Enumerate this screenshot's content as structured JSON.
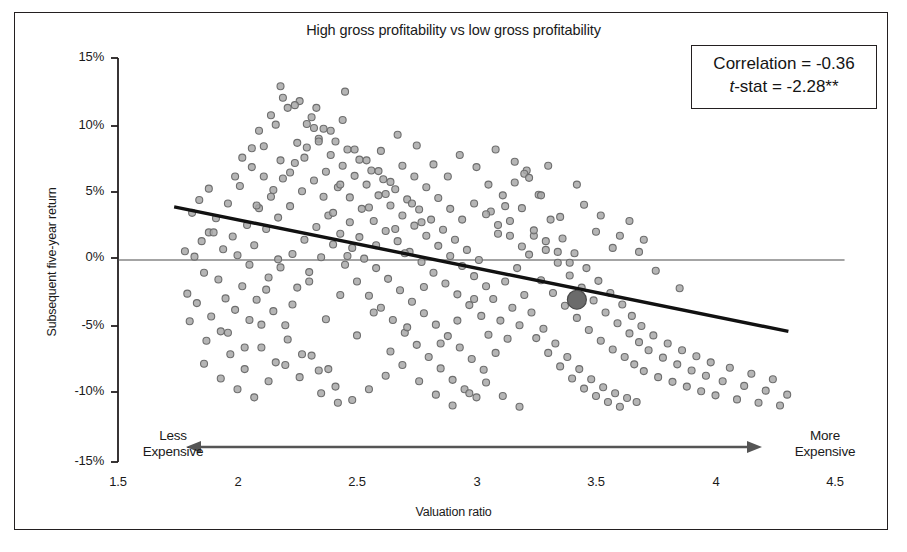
{
  "figure": {
    "title": "High gross profitability vs low gross profitability",
    "frame_color": "#231f20",
    "background": "#ffffff"
  },
  "stats_box": {
    "correlation_label": "Correlation = -0.36",
    "tstat_prefix": "t",
    "tstat_rest": "-stat = -2.28**"
  },
  "annotations": {
    "left_line1": "Less",
    "left_line2": "Expensive",
    "right_line1": "More",
    "right_line2": "Expensive",
    "arrow_name": "double-headed-arrow"
  },
  "chart_data": {
    "type": "scatter",
    "title": "High gross profitability vs low gross profitability",
    "xlabel": "Valuation ratio",
    "ylabel": "Subsequent five-year return",
    "xlim": [
      1.5,
      4.5
    ],
    "ylim": [
      -0.15,
      0.15
    ],
    "xticks": [
      1.5,
      2,
      2.5,
      3,
      3.5,
      4,
      4.5
    ],
    "xticklabels": [
      "1.5",
      "2",
      "2.5",
      "3",
      "3.5",
      "4",
      "4.5"
    ],
    "yticks": [
      0.15,
      0.1,
      0.05,
      0.0,
      -0.05,
      -0.1,
      -0.15
    ],
    "yticklabels": [
      "15%",
      "10%",
      "5%",
      "0%",
      "-5%",
      "-10%",
      "-15%"
    ],
    "grid": false,
    "legend": "none",
    "correlation": -0.36,
    "t_stat": -2.28,
    "significance": "**",
    "marker": {
      "shape": "circle",
      "fill": "#a8a8a8",
      "stroke": "#6e6e6e",
      "size_px": 7,
      "opacity": 0.85
    },
    "trendline": {
      "name": "linear-fit",
      "color": "#111111",
      "width_px": 3.4,
      "x_start": 1.735,
      "y_start": 0.0395,
      "x_end": 4.305,
      "y_end": -0.053
    },
    "zero_line": {
      "name": "zero-reference-line",
      "y": 0.0,
      "color": "#4b4b4b",
      "width_px": 1.1,
      "x_start": 1.5,
      "x_end": 4.54
    },
    "highlight_point": {
      "name": "current-valuation-marker",
      "x": 3.42,
      "y": -0.0295,
      "fill": "#6b6b6b",
      "stroke": "#4a4a4a",
      "size_px": 19
    },
    "points": [
      [
        1.78,
        0.0065
      ],
      [
        1.79,
        -0.025
      ],
      [
        1.8,
        -0.0455
      ],
      [
        1.82,
        0.0025
      ],
      [
        1.83,
        -0.032
      ],
      [
        1.85,
        0.014
      ],
      [
        1.86,
        -0.0095
      ],
      [
        1.87,
        -0.06
      ],
      [
        1.88,
        0.0205
      ],
      [
        1.89,
        -0.042
      ],
      [
        1.91,
        0.031
      ],
      [
        1.92,
        -0.0145
      ],
      [
        1.93,
        -0.053
      ],
      [
        1.94,
        0.008
      ],
      [
        1.95,
        -0.0285
      ],
      [
        1.96,
        0.042
      ],
      [
        1.97,
        -0.07
      ],
      [
        1.98,
        0.0175
      ],
      [
        1.99,
        -0.037
      ],
      [
        2.0,
        0.0035
      ],
      [
        2.01,
        0.055
      ],
      [
        2.02,
        -0.0195
      ],
      [
        2.03,
        -0.081
      ],
      [
        2.04,
        0.026
      ],
      [
        2.05,
        -0.0445
      ],
      [
        2.06,
        0.069
      ],
      [
        2.07,
        0.011
      ],
      [
        2.08,
        -0.0295
      ],
      [
        2.09,
        0.0385
      ],
      [
        2.1,
        -0.065
      ],
      [
        2.11,
        0.0845
      ],
      [
        2.12,
        0.023
      ],
      [
        2.13,
        -0.013
      ],
      [
        2.14,
        0.047
      ],
      [
        2.15,
        -0.038
      ],
      [
        2.16,
        0.1005
      ],
      [
        2.17,
        0.0315
      ],
      [
        2.18,
        -0.0055
      ],
      [
        2.19,
        0.0605
      ],
      [
        2.2,
        -0.0485
      ],
      [
        2.21,
        0.113
      ],
      [
        2.22,
        0.04
      ],
      [
        2.23,
        0.0045
      ],
      [
        2.24,
        0.072
      ],
      [
        2.25,
        -0.0205
      ],
      [
        2.26,
        0.118
      ],
      [
        2.27,
        0.051
      ],
      [
        2.28,
        0.015
      ],
      [
        2.29,
        0.0835
      ],
      [
        2.3,
        -0.009
      ],
      [
        2.31,
        0.106
      ],
      [
        2.32,
        0.059
      ],
      [
        2.33,
        0.0245
      ],
      [
        2.34,
        0.09
      ],
      [
        2.35,
        0.002
      ],
      [
        2.36,
        0.0975
      ],
      [
        2.37,
        0.0655
      ],
      [
        2.38,
        0.033
      ],
      [
        2.39,
        0.078
      ],
      [
        2.4,
        0.0115
      ],
      [
        2.41,
        0.088
      ],
      [
        2.42,
        0.054
      ],
      [
        2.43,
        0.0195
      ],
      [
        2.44,
        0.07
      ],
      [
        2.45,
        -0.0035
      ],
      [
        2.46,
        0.082
      ],
      [
        2.47,
        0.0465
      ],
      [
        2.48,
        0.009
      ],
      [
        2.49,
        0.0625
      ],
      [
        2.5,
        -0.016
      ],
      [
        2.51,
        0.0745
      ],
      [
        2.52,
        0.038
      ],
      [
        2.53,
        0.001
      ],
      [
        2.54,
        0.056
      ],
      [
        2.55,
        -0.0265
      ],
      [
        2.56,
        0.0665
      ],
      [
        2.57,
        0.029
      ],
      [
        2.58,
        -0.006
      ],
      [
        2.59,
        0.048
      ],
      [
        2.6,
        -0.0355
      ],
      [
        2.61,
        0.06
      ],
      [
        2.62,
        0.0215
      ],
      [
        2.63,
        -0.014
      ],
      [
        2.64,
        0.0405
      ],
      [
        2.65,
        -0.0445
      ],
      [
        2.66,
        0.0525
      ],
      [
        2.67,
        0.014
      ],
      [
        2.68,
        -0.0225
      ],
      [
        2.69,
        0.033
      ],
      [
        2.7,
        -0.054
      ],
      [
        2.71,
        0.045
      ],
      [
        2.72,
        0.006
      ],
      [
        2.73,
        -0.031
      ],
      [
        2.74,
        0.0255
      ],
      [
        2.75,
        -0.063
      ],
      [
        2.76,
        0.0375
      ],
      [
        2.77,
        -0.0015
      ],
      [
        2.78,
        -0.0395
      ],
      [
        2.79,
        0.018
      ],
      [
        2.8,
        -0.072
      ],
      [
        2.81,
        0.03
      ],
      [
        2.82,
        -0.0095
      ],
      [
        2.83,
        -0.048
      ],
      [
        2.84,
        0.0105
      ],
      [
        2.85,
        -0.0805
      ],
      [
        2.86,
        0.0225
      ],
      [
        2.87,
        -0.0175
      ],
      [
        2.88,
        -0.0565
      ],
      [
        2.89,
        0.003
      ],
      [
        2.9,
        -0.089
      ],
      [
        2.91,
        0.015
      ],
      [
        2.92,
        -0.0255
      ],
      [
        2.93,
        -0.065
      ],
      [
        2.94,
        -0.0045
      ],
      [
        2.95,
        -0.096
      ],
      [
        2.96,
        0.0075
      ],
      [
        2.97,
        -0.0335
      ],
      [
        2.98,
        -0.0735
      ],
      [
        2.99,
        -0.012
      ],
      [
        3.0,
        -0.102
      ],
      [
        3.01,
        0.0
      ],
      [
        3.02,
        -0.0415
      ],
      [
        3.03,
        -0.0815
      ],
      [
        3.04,
        -0.0195
      ],
      [
        3.05,
        -0.0555
      ],
      [
        3.06,
        0.036
      ],
      [
        3.07,
        -0.029
      ],
      [
        3.08,
        -0.069
      ],
      [
        3.09,
        0.0195
      ],
      [
        3.1,
        -0.045
      ],
      [
        3.11,
        0.048
      ],
      [
        3.12,
        -0.016
      ],
      [
        3.13,
        -0.0585
      ],
      [
        3.14,
        0.029
      ],
      [
        3.15,
        -0.0355
      ],
      [
        3.16,
        0.0575
      ],
      [
        3.17,
        -0.006
      ],
      [
        3.18,
        -0.0485
      ],
      [
        3.19,
        0.0385
      ],
      [
        3.2,
        -0.026
      ],
      [
        3.21,
        0.0665
      ],
      [
        3.22,
        0.004
      ],
      [
        3.23,
        -0.039
      ],
      [
        3.24,
        0.018
      ],
      [
        3.25,
        -0.058
      ],
      [
        3.26,
        0.0485
      ],
      [
        3.27,
        -0.015
      ],
      [
        3.28,
        -0.051
      ],
      [
        3.29,
        0.0075
      ],
      [
        3.3,
        -0.069
      ],
      [
        3.31,
        0.03
      ],
      [
        3.32,
        -0.0245
      ],
      [
        3.33,
        -0.062
      ],
      [
        3.34,
        -0.002
      ],
      [
        3.35,
        -0.079
      ],
      [
        3.36,
        0.016
      ],
      [
        3.37,
        -0.034
      ],
      [
        3.38,
        -0.072
      ],
      [
        3.39,
        -0.0115
      ],
      [
        3.4,
        -0.088
      ],
      [
        3.41,
        0.005
      ],
      [
        3.42,
        -0.043
      ],
      [
        3.43,
        -0.081
      ],
      [
        3.44,
        -0.0205
      ],
      [
        3.45,
        -0.0955
      ],
      [
        3.46,
        -0.006
      ],
      [
        3.47,
        -0.052
      ],
      [
        3.48,
        -0.0885
      ],
      [
        3.49,
        -0.03
      ],
      [
        3.5,
        -0.101
      ],
      [
        3.51,
        -0.0155
      ],
      [
        3.52,
        -0.06
      ],
      [
        3.53,
        -0.0945
      ],
      [
        3.54,
        -0.039
      ],
      [
        3.55,
        -0.1055
      ],
      [
        3.56,
        -0.0245
      ],
      [
        3.57,
        -0.0665
      ],
      [
        3.58,
        -0.099
      ],
      [
        3.59,
        -0.047
      ],
      [
        3.6,
        -0.109
      ],
      [
        3.61,
        -0.033
      ],
      [
        3.62,
        -0.072
      ],
      [
        3.63,
        -0.1025
      ],
      [
        3.64,
        -0.0545
      ],
      [
        3.65,
        -0.0415
      ],
      [
        3.66,
        -0.0775
      ],
      [
        3.67,
        -0.1055
      ],
      [
        3.68,
        -0.061
      ],
      [
        3.69,
        -0.049
      ],
      [
        3.7,
        -0.0825
      ],
      [
        3.72,
        -0.067
      ],
      [
        3.74,
        -0.056
      ],
      [
        3.76,
        -0.087
      ],
      [
        3.78,
        -0.0725
      ],
      [
        3.8,
        -0.062
      ],
      [
        3.82,
        -0.0905
      ],
      [
        3.84,
        -0.0775
      ],
      [
        3.86,
        -0.067
      ],
      [
        3.88,
        -0.094
      ],
      [
        3.9,
        -0.082
      ],
      [
        3.92,
        -0.0715
      ],
      [
        3.94,
        -0.0975
      ],
      [
        3.96,
        -0.086
      ],
      [
        3.98,
        -0.076
      ],
      [
        4.0,
        -0.1005
      ],
      [
        4.03,
        -0.09
      ],
      [
        4.06,
        -0.08
      ],
      [
        4.09,
        -0.1035
      ],
      [
        4.12,
        -0.0935
      ],
      [
        4.15,
        -0.0845
      ],
      [
        4.18,
        -0.106
      ],
      [
        4.21,
        -0.097
      ],
      [
        4.24,
        -0.0885
      ],
      [
        4.27,
        -0.108
      ],
      [
        4.3,
        -0.1
      ],
      [
        1.84,
        0.0445
      ],
      [
        1.9,
        0.0205
      ],
      [
        2.02,
        0.076
      ],
      [
        2.09,
        0.096
      ],
      [
        2.14,
        0.1075
      ],
      [
        2.19,
        0.1205
      ],
      [
        2.24,
        0.115
      ],
      [
        2.29,
        0.101
      ],
      [
        2.34,
        0.088
      ],
      [
        2.39,
        0.096
      ],
      [
        2.44,
        0.104
      ],
      [
        2.49,
        0.082
      ],
      [
        2.54,
        0.074
      ],
      [
        2.59,
        0.066
      ],
      [
        2.64,
        0.058
      ],
      [
        2.69,
        0.07
      ],
      [
        2.74,
        0.062
      ],
      [
        2.79,
        0.054
      ],
      [
        2.84,
        0.046
      ],
      [
        2.89,
        0.038
      ],
      [
        2.94,
        0.03
      ],
      [
        2.99,
        0.042
      ],
      [
        3.04,
        0.034
      ],
      [
        3.09,
        0.026
      ],
      [
        3.14,
        0.018
      ],
      [
        3.19,
        0.01
      ],
      [
        3.24,
        0.022
      ],
      [
        3.29,
        0.014
      ],
      [
        3.34,
        0.006
      ],
      [
        3.39,
        -0.002
      ],
      [
        1.86,
        -0.077
      ],
      [
        1.93,
        -0.088
      ],
      [
        2.0,
        -0.096
      ],
      [
        2.07,
        -0.102
      ],
      [
        2.13,
        -0.09
      ],
      [
        2.2,
        -0.078
      ],
      [
        2.27,
        -0.07
      ],
      [
        2.34,
        -0.082
      ],
      [
        2.41,
        -0.094
      ],
      [
        2.48,
        -0.104
      ],
      [
        2.55,
        -0.096
      ],
      [
        2.62,
        -0.086
      ],
      [
        2.69,
        -0.078
      ],
      [
        2.76,
        -0.09
      ],
      [
        2.83,
        -0.1
      ],
      [
        2.9,
        -0.108
      ],
      [
        2.97,
        -0.099
      ],
      [
        3.04,
        -0.091
      ],
      [
        3.11,
        -0.101
      ],
      [
        3.18,
        -0.109
      ],
      [
        2.08,
        0.0405
      ],
      [
        2.11,
        0.062
      ],
      [
        2.15,
        0.052
      ],
      [
        2.18,
        0.074
      ],
      [
        2.22,
        0.065
      ],
      [
        2.25,
        0.087
      ],
      [
        2.28,
        0.076
      ],
      [
        2.32,
        0.098
      ],
      [
        2.36,
        0.047
      ],
      [
        2.4,
        0.035
      ],
      [
        2.43,
        0.056
      ],
      [
        2.47,
        0.028
      ],
      [
        2.51,
        0.017
      ],
      [
        2.55,
        0.039
      ],
      [
        2.58,
        0.011
      ],
      [
        2.62,
        0.049
      ],
      [
        2.66,
        0.023
      ],
      [
        2.7,
        0.005
      ],
      [
        2.73,
        0.042
      ],
      [
        2.77,
        0.028
      ],
      [
        2.05,
        -0.0035
      ],
      [
        2.12,
        -0.022
      ],
      [
        2.17,
        0.0005
      ],
      [
        2.23,
        -0.033
      ],
      [
        2.3,
        -0.016
      ],
      [
        2.37,
        -0.044
      ],
      [
        2.43,
        -0.026
      ],
      [
        2.5,
        -0.056
      ],
      [
        2.57,
        -0.039
      ],
      [
        2.64,
        -0.068
      ],
      [
        2.71,
        -0.05
      ],
      [
        2.78,
        -0.02
      ],
      [
        2.85,
        -0.062
      ],
      [
        2.92,
        -0.045
      ],
      [
        2.99,
        -0.029
      ],
      [
        1.96,
        -0.054
      ],
      [
        2.03,
        -0.065
      ],
      [
        2.1,
        -0.048
      ],
      [
        2.16,
        -0.076
      ],
      [
        2.21,
        -0.059
      ],
      [
        2.26,
        -0.087
      ],
      [
        2.31,
        -0.071
      ],
      [
        2.35,
        -0.099
      ],
      [
        2.38,
        -0.081
      ],
      [
        2.42,
        -0.106
      ],
      [
        3.05,
        0.056
      ],
      [
        3.12,
        0.04
      ],
      [
        3.2,
        0.064
      ],
      [
        3.27,
        0.048
      ],
      [
        3.35,
        0.032
      ],
      [
        3.42,
        0.056
      ],
      [
        3.5,
        0.021
      ],
      [
        3.57,
        0.009
      ],
      [
        3.64,
        0.029
      ],
      [
        3.7,
        0.015
      ],
      [
        2.45,
        0.125
      ],
      [
        2.18,
        0.129
      ],
      [
        2.33,
        0.113
      ],
      [
        3.3,
        0.07
      ],
      [
        3.45,
        0.041
      ],
      [
        1.81,
        0.035
      ],
      [
        1.88,
        0.053
      ],
      [
        1.99,
        0.062
      ],
      [
        2.06,
        0.083
      ],
      [
        2.46,
        0.003
      ],
      [
        3.52,
        0.033
      ],
      [
        3.6,
        0.018
      ],
      [
        3.68,
        0.006
      ],
      [
        3.75,
        -0.008
      ],
      [
        3.85,
        -0.021
      ],
      [
        2.6,
        0.081
      ],
      [
        2.67,
        0.093
      ],
      [
        2.75,
        0.085
      ],
      [
        2.82,
        0.071
      ],
      [
        2.88,
        0.062
      ],
      [
        2.93,
        0.078
      ],
      [
        3.0,
        0.069
      ],
      [
        3.08,
        0.082
      ],
      [
        3.16,
        0.073
      ],
      [
        3.22,
        0.061
      ]
    ]
  },
  "axes": {
    "y_ticks_px": [
      {
        "label": "15%",
        "y": 58
      },
      {
        "label": "10%",
        "y": 126
      },
      {
        "label": "5%",
        "y": 192
      },
      {
        "label": "0%",
        "y": 258
      },
      {
        "label": "-5%",
        "y": 326
      },
      {
        "label": "-10%",
        "y": 392
      },
      {
        "label": "-15%",
        "y": 462
      }
    ],
    "x_ticks_px": [
      {
        "label": "1.5",
        "x": 118
      },
      {
        "label": "2",
        "x": 238
      },
      {
        "label": "2.5",
        "x": 357
      },
      {
        "label": "3",
        "x": 477
      },
      {
        "label": "3.5",
        "x": 596
      },
      {
        "label": "4",
        "x": 716
      },
      {
        "label": "4.5",
        "x": 835
      }
    ]
  }
}
